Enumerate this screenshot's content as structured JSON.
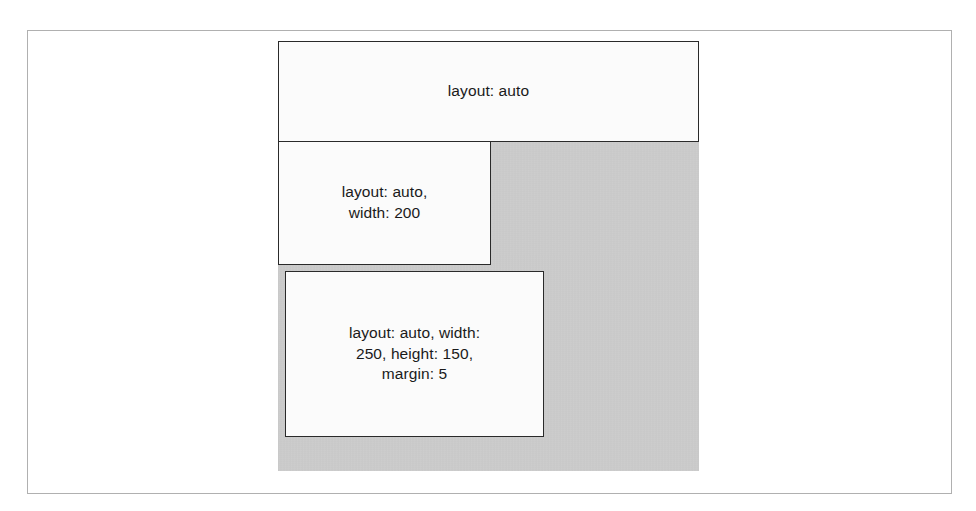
{
  "figure": {
    "container": {
      "name": "layout-container",
      "fill_color": "#c9c9c9"
    },
    "frame": {
      "border_color": "#b0b0b0"
    },
    "box_style": {
      "fill_color": "#fbfbfb",
      "border_color": "#2a2a2a",
      "text_color": "#1a1a1a"
    },
    "boxes": [
      {
        "id": "box-auto",
        "label": "layout: auto"
      },
      {
        "id": "box-auto-width",
        "label": "layout: auto,\nwidth: 200"
      },
      {
        "id": "box-auto-width-height-margin",
        "label": "layout: auto, width:\n250, height: 150,\nmargin: 5"
      }
    ]
  }
}
